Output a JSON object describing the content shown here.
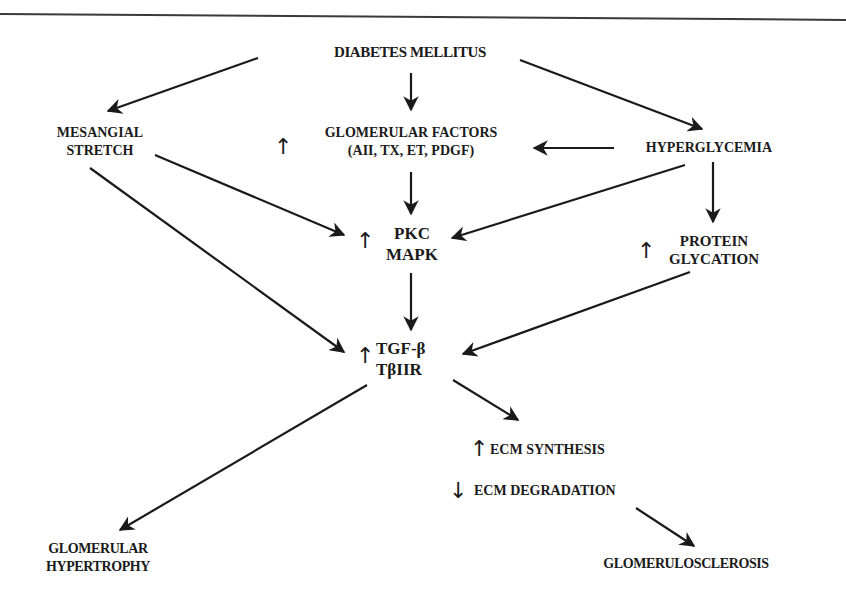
{
  "diagram": {
    "nodes": {
      "diabetes": {
        "lines": [
          "DIABETES MELLITUS"
        ]
      },
      "mesangial": {
        "lines": [
          "MESANGIAL",
          "STRETCH"
        ]
      },
      "glomerular_factors": {
        "lines": [
          "GLOMERULAR FACTORS",
          "(AII, TX, ET, PDGF)"
        ],
        "indicator": "↑"
      },
      "hyperglycemia": {
        "lines": [
          "HYPERGLYCEMIA"
        ]
      },
      "pkc": {
        "lines": [
          "PKC",
          "MAPK"
        ],
        "indicator": "↑"
      },
      "protein_glycation": {
        "lines": [
          "PROTEIN",
          "GLYCATION"
        ],
        "indicator": "↑"
      },
      "tgf": {
        "lines": [
          "TGF-β",
          "TβIIR"
        ],
        "indicator": "↑"
      },
      "ecm_synthesis": {
        "lines": [
          "ECM SYNTHESIS"
        ],
        "indicator": "↑"
      },
      "ecm_degradation": {
        "lines": [
          "ECM DEGRADATION"
        ],
        "indicator": "↓"
      },
      "hypertrophy": {
        "lines": [
          "GLOMERULAR",
          "HYPERTROPHY"
        ]
      },
      "glomerulosclerosis": {
        "lines": [
          "GLOMERULOSCLEROSIS"
        ]
      }
    },
    "edges": [
      {
        "from": "DIABETES MELLITUS",
        "to": "MESANGIAL STRETCH"
      },
      {
        "from": "DIABETES MELLITUS",
        "to": "GLOMERULAR FACTORS"
      },
      {
        "from": "DIABETES MELLITUS",
        "to": "HYPERGLYCEMIA"
      },
      {
        "from": "HYPERGLYCEMIA",
        "to": "GLOMERULAR FACTORS"
      },
      {
        "from": "HYPERGLYCEMIA",
        "to": "PKC MAPK"
      },
      {
        "from": "HYPERGLYCEMIA",
        "to": "PROTEIN GLYCATION"
      },
      {
        "from": "MESANGIAL STRETCH",
        "to": "PKC MAPK"
      },
      {
        "from": "MESANGIAL STRETCH",
        "to": "TGF-β TβIIR"
      },
      {
        "from": "GLOMERULAR FACTORS",
        "to": "PKC MAPK"
      },
      {
        "from": "PKC MAPK",
        "to": "TGF-β TβIIR"
      },
      {
        "from": "PROTEIN GLYCATION",
        "to": "TGF-β TβIIR"
      },
      {
        "from": "TGF-β TβIIR",
        "to": "GLOMERULAR HYPERTROPHY"
      },
      {
        "from": "TGF-β TβIIR",
        "to": "ECM SYNTHESIS"
      },
      {
        "from": "ECM DEGRADATION",
        "to": "GLOMERULOSCLEROSIS"
      }
    ]
  }
}
